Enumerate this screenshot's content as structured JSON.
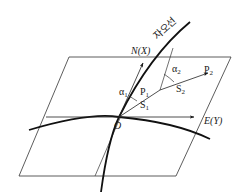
{
  "diagram": {
    "title": "",
    "labels": {
      "meridian": "자오선",
      "north_axis": "N(X)",
      "east_axis": "E(Y)",
      "origin": "O",
      "p1": "P",
      "p1_sub": "1",
      "p2": "P",
      "p2_sub": "2",
      "s1": "S",
      "s1_sub": "1",
      "s2": "S",
      "s2_sub": "2",
      "alpha1": "α",
      "alpha1_sub": "1",
      "alpha2": "α",
      "alpha2_sub": "2"
    },
    "colors": {
      "line": "#1a1a1a",
      "background": "#ffffff"
    }
  }
}
